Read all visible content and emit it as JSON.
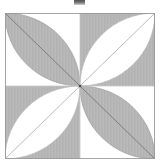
{
  "page": {
    "title": "Four-petal rosette geometric figure",
    "background_color": "#ffffff",
    "width": 162,
    "height": 165
  },
  "artifact": {
    "name": "cropped-text-fragment",
    "label": "",
    "color": "#3a3a3a"
  },
  "figure": {
    "caption": "",
    "frame_color": "#9a9a9a",
    "fill_gray": "#b6b6b6",
    "fill_white": "#ffffff",
    "line_color": "#8a8a8a",
    "diagonal_color": "#707070",
    "hatch": "vertical-fine-lines",
    "origin_x": 5,
    "origin_y": 13,
    "size_w": 150,
    "size_h": 146,
    "grid": "2x2",
    "petal_count": 4
  },
  "chart_data": {
    "type": "diagram",
    "title": "",
    "description": "Square divided into a 2x2 grid of equal squares; each square contains a lens (vesica) petal bounded by two quarter-circle arcs drawn from opposite corners, so the four petals meet at the center of the large square forming a rosette. Shading alternates in checkerboard fashion: petals in the top-left and bottom-right squares are gray on white, petals in the top-right and bottom-left squares are white on gray. A straight diagonal line runs along the long axis of each petal.",
    "quadrants": [
      {
        "name": "top-left",
        "row": 0,
        "col": 0,
        "background": "#ffffff",
        "petal_fill": "#b6b6b6",
        "petal_axis": "corner-to-center-diagonal",
        "axis_from": "top-left-corner",
        "axis_to": "center"
      },
      {
        "name": "top-right",
        "row": 0,
        "col": 1,
        "background": "#b6b6b6",
        "petal_fill": "#ffffff",
        "petal_axis": "corner-to-center-diagonal",
        "axis_from": "top-right-corner",
        "axis_to": "center"
      },
      {
        "name": "bottom-left",
        "row": 1,
        "col": 0,
        "background": "#b6b6b6",
        "petal_fill": "#ffffff",
        "petal_axis": "corner-to-center-diagonal",
        "axis_from": "bottom-left-corner",
        "axis_to": "center"
      },
      {
        "name": "bottom-right",
        "row": 1,
        "col": 1,
        "background": "#ffffff",
        "petal_fill": "#b6b6b6",
        "petal_axis": "corner-to-center-diagonal",
        "axis_from": "bottom-right-corner",
        "axis_to": "center"
      }
    ],
    "labels": [],
    "tick_labels": [],
    "legend": []
  }
}
